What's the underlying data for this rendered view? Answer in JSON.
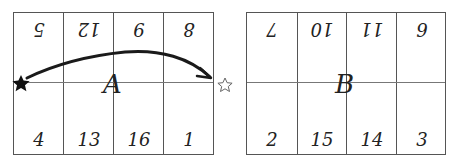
{
  "grids": [
    {
      "label": "A",
      "top_row_upside_down": [
        "5",
        "12",
        "9",
        "8"
      ],
      "bottom_row": [
        "4",
        "13",
        "16",
        "1"
      ]
    },
    {
      "label": "B",
      "top_row_upside_down": [
        "7",
        "10",
        "11",
        "6"
      ],
      "bottom_row": [
        "2",
        "15",
        "14",
        "3"
      ]
    }
  ],
  "markers": {
    "start": "filled-star",
    "end": "outline-star",
    "arrow": "curved arrow from filled star (left edge of A) to outline star (right edge of A)"
  },
  "colors": {
    "line": "#555555",
    "ink": "#1a1a1a",
    "background": "#ffffff"
  }
}
